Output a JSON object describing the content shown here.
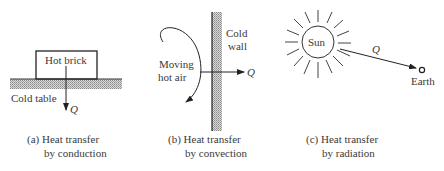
{
  "figure": {
    "panels": [
      {
        "id": "a",
        "caption_line1": "(a) Heat transfer",
        "caption_line2": "by conduction",
        "labels": {
          "object": "Hot brick",
          "surface": "Cold table",
          "heat": "Q"
        }
      },
      {
        "id": "b",
        "caption_line1": "(b) Heat transfer",
        "caption_line2": "by convection",
        "labels": {
          "fluid_line1": "Moving",
          "fluid_line2": "hot air",
          "wall_line1": "Cold",
          "wall_line2": "wall",
          "heat": "Q"
        }
      },
      {
        "id": "c",
        "caption_line1": "(c) Heat transfer",
        "caption_line2": "by radiation",
        "labels": {
          "source": "Sun",
          "target": "Earth",
          "heat": "Q"
        }
      }
    ]
  }
}
